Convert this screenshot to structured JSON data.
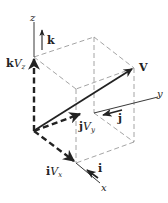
{
  "diagram": {
    "axes": {
      "x": {
        "label": "x"
      },
      "y": {
        "label": "y"
      },
      "z": {
        "label": "z"
      }
    },
    "unit_vectors": {
      "i": {
        "label": "i"
      },
      "j": {
        "label": "j"
      },
      "k": {
        "label": "k"
      }
    },
    "components": {
      "x": {
        "unit": "i",
        "var": "V",
        "sub": "x"
      },
      "y": {
        "unit": "j",
        "var": "V",
        "sub": "y"
      },
      "z": {
        "unit": "k",
        "var": "V",
        "sub": "z"
      }
    },
    "vector": {
      "label": "V"
    },
    "colors": {
      "ink": "#222222",
      "dashed_box": "#9a9a9a",
      "background": "#ffffff"
    }
  }
}
